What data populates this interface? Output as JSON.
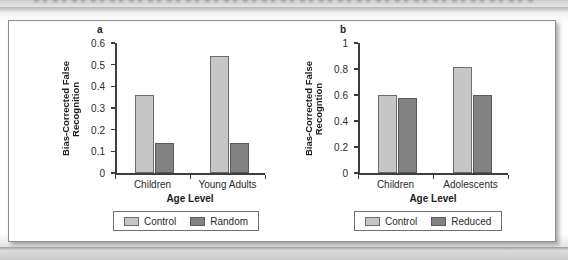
{
  "page": {
    "top_band_note": "",
    "background_color": "#ffffff"
  },
  "figure": {
    "card_border_color": "#8d8d8d",
    "panels": [
      {
        "letter": "a",
        "legend": {
          "items": [
            {
              "label": "Control",
              "color": "#c6c6c6"
            },
            {
              "label": "Random",
              "color": "#828282"
            }
          ]
        },
        "chart_data": {
          "type": "bar",
          "title": "",
          "xlabel": "Age Level",
          "ylabel_lines": [
            "Bias-Corrected False",
            "Recognition"
          ],
          "ylabel": "Bias-Corrected False Recognition",
          "categories": [
            "Children",
            "Young Adults"
          ],
          "series": [
            {
              "name": "Control",
              "values": [
                0.36,
                0.54
              ],
              "color": "#c6c6c6"
            },
            {
              "name": "Random",
              "values": [
                0.14,
                0.14
              ],
              "color": "#828282"
            }
          ],
          "ylim": [
            0,
            0.6
          ],
          "yticks": [
            0,
            0.1,
            0.2,
            0.3,
            0.4,
            0.5,
            0.6
          ],
          "ytick_labels": [
            "0",
            "0.1",
            "0.2",
            "0.3",
            "0.4",
            "0.5",
            "0.6"
          ],
          "grid": false,
          "legend_position": "below"
        }
      },
      {
        "letter": "b",
        "legend": {
          "items": [
            {
              "label": "Control",
              "color": "#c6c6c6"
            },
            {
              "label": "Reduced",
              "color": "#828282"
            }
          ]
        },
        "chart_data": {
          "type": "bar",
          "title": "",
          "xlabel": "Age Level",
          "ylabel_lines": [
            "Bias-Corrected False",
            "Recogntion"
          ],
          "ylabel": "Bias-Corrected False Recogntion",
          "categories": [
            "Children",
            "Adolescents"
          ],
          "series": [
            {
              "name": "Control",
              "values": [
                0.6,
                0.82
              ],
              "color": "#c6c6c6"
            },
            {
              "name": "Reduced",
              "values": [
                0.58,
                0.6
              ],
              "color": "#828282"
            }
          ],
          "ylim": [
            0,
            1
          ],
          "yticks": [
            0,
            0.2,
            0.4,
            0.6,
            0.8,
            1
          ],
          "ytick_labels": [
            "0",
            "0.2",
            "0.4",
            "0.6",
            "0.8",
            "1"
          ],
          "grid": false,
          "legend_position": "below"
        }
      }
    ]
  }
}
